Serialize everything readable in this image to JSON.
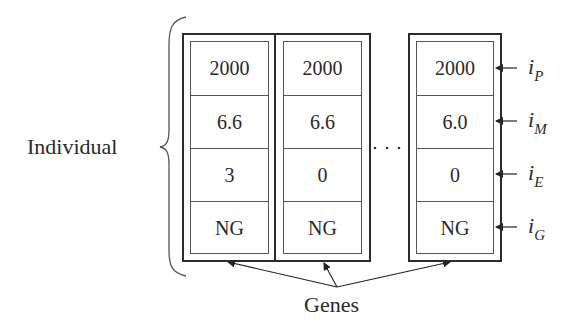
{
  "diagram": {
    "individual_label": "Individual",
    "genes_label": "Genes",
    "ellipsis": "···",
    "component_labels": [
      {
        "base": "i",
        "sub": "P"
      },
      {
        "base": "i",
        "sub": "M"
      },
      {
        "base": "i",
        "sub": "E"
      },
      {
        "base": "i",
        "sub": "G"
      }
    ],
    "genes": [
      {
        "values": [
          "2000",
          "6.6",
          "3",
          "NG"
        ]
      },
      {
        "values": [
          "2000",
          "6.6",
          "0",
          "NG"
        ]
      },
      {
        "values": [
          "2000",
          "6.0",
          "0",
          "NG"
        ]
      }
    ]
  }
}
